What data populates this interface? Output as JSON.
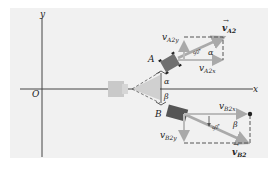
{
  "diagram": {
    "axes": {
      "y_label": "y",
      "x_label": "x",
      "origin_label": "O"
    },
    "points": {
      "A": "A",
      "B": "B"
    },
    "angles": {
      "alpha": "α",
      "beta": "β",
      "right_angle_marker": "90°"
    },
    "vectors": {
      "vA2": {
        "symbol": "v",
        "subscript": "A2"
      },
      "vA2x": {
        "symbol": "v",
        "subscript": "A2x"
      },
      "vA2y": {
        "symbol": "v",
        "subscript": "A2y"
      },
      "vB2": {
        "symbol": "v",
        "subscript": "B2"
      },
      "vB2x": {
        "symbol": "v",
        "subscript": "B2x"
      },
      "vB2y": {
        "symbol": "v",
        "subscript": "B2y"
      }
    },
    "colors": {
      "panel": "#f1f1f1",
      "axis": "#444444",
      "car_dark": "#6a6a6a",
      "car_light": "#c9c9c9",
      "vector_arrow": "#b0b0b0",
      "dashed": "#555555"
    }
  }
}
